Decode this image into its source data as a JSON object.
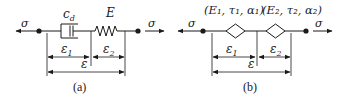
{
  "panel_a": {
    "caption": "(a)",
    "stress_left": "σ",
    "stress_right": "σ",
    "dashpot_label": "c",
    "dashpot_sub": "d",
    "spring_label": "E",
    "strain_1": "ε",
    "strain_1_sub": "1",
    "strain_2": "ε",
    "strain_2_sub": "2",
    "strain_total": "ε"
  },
  "panel_b": {
    "caption": "(b)",
    "stress_left": "σ",
    "stress_right": "σ",
    "element_1_params": "(E₁, τ₁, α₁)",
    "element_2_params": "(E₂, τ₂, α₂)",
    "strain_1": "ε",
    "strain_1_sub": "1",
    "strain_2": "ε",
    "strain_2_sub": "2",
    "strain_total": "ε"
  },
  "colors": {
    "ink": "#1a1a1a",
    "background": "#ffffff"
  }
}
